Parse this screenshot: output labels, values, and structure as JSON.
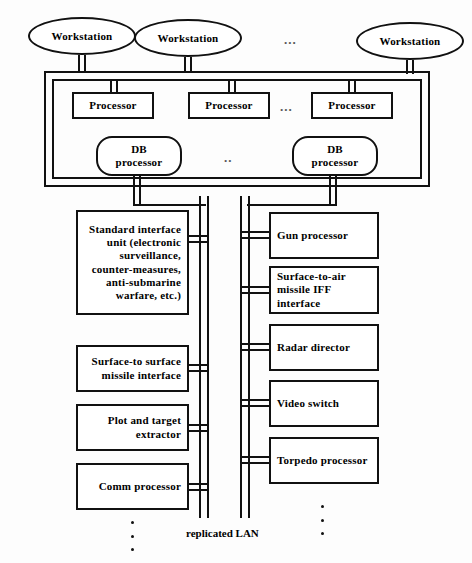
{
  "diagram": {
    "bus_label": "replicated LAN",
    "ellipsis_horizontal": "...",
    "ellipsis_db": "..",
    "colors": {
      "stroke": "#111111",
      "background": "#fdfdfd",
      "node_fill": "#ffffff",
      "dots": "#555555"
    }
  },
  "workstations": [
    {
      "label": "Workstation"
    },
    {
      "label": "Workstation"
    },
    {
      "label": "Workstation"
    }
  ],
  "processors": [
    {
      "label": "Processor"
    },
    {
      "label": "Processor"
    },
    {
      "label": "Processor"
    }
  ],
  "db_processors": [
    {
      "line1": "DB",
      "line2": "processor"
    },
    {
      "line1": "DB",
      "line2": "processor"
    }
  ],
  "left_units": [
    {
      "name": "standard-interface-unit",
      "text": "Standard interface unit (electronic surveillance, counter-measures, anti-submarine warfare, etc.)"
    },
    {
      "name": "surface-to-surface-missile-interface",
      "text": "Surface-to surface missile interface"
    },
    {
      "name": "plot-and-target-extractor",
      "text": "Plot and target extractor"
    },
    {
      "name": "comm-processor",
      "text": "Comm processor"
    }
  ],
  "right_units": [
    {
      "name": "gun-processor",
      "text": "Gun processor"
    },
    {
      "name": "surface-to-air-missile-iff-interface",
      "text": "Surface-to-air missile IFF interface"
    },
    {
      "name": "radar-director",
      "text": "Radar director"
    },
    {
      "name": "video-switch",
      "text": "Video switch"
    },
    {
      "name": "torpedo-processor",
      "text": "Torpedo processor"
    }
  ]
}
